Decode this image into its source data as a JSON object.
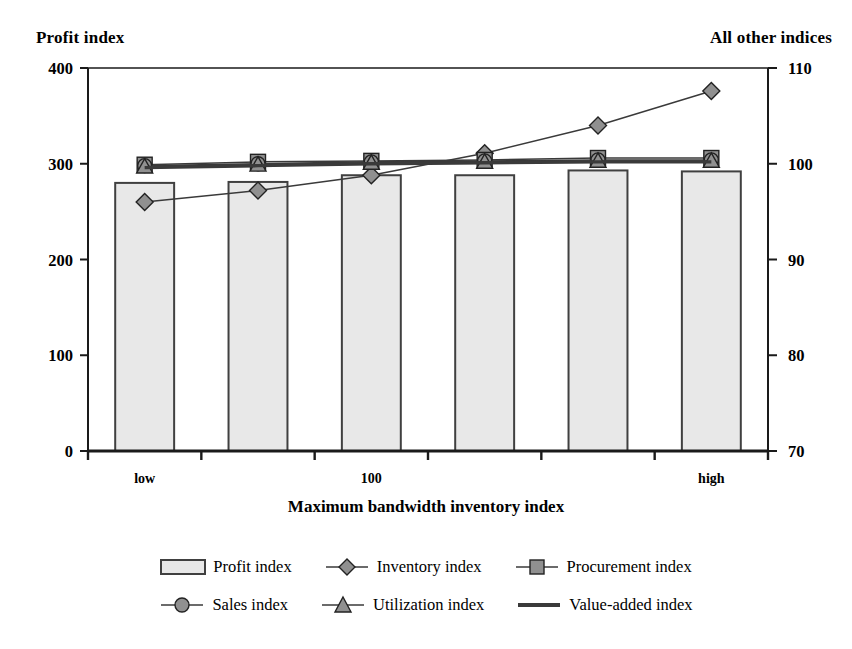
{
  "axis_titles": {
    "left": "Profit index",
    "right": "All other indices",
    "x": "Maximum bandwidth inventory index"
  },
  "colors": {
    "bar_fill": "#e8e8e8",
    "bar_border": "#404040",
    "marker_fill": "#909090",
    "line": "#3a3a3a",
    "axis": "#1a1a1a",
    "text": "#000000"
  },
  "chart_data": {
    "type": "bar",
    "title": "",
    "xlabel": "Maximum bandwidth inventory index",
    "ylabel": "Profit index",
    "y2label": "All other indices",
    "ylim": [
      0,
      400
    ],
    "y2lim": [
      70,
      110
    ],
    "yticks": [
      0,
      100,
      200,
      300,
      400
    ],
    "y2ticks": [
      70,
      80,
      90,
      100,
      110
    ],
    "grid": false,
    "legend_position": "bottom",
    "categories": [
      "low",
      "",
      "100",
      "",
      "",
      "high"
    ],
    "xtick_labels": [
      "low",
      "100",
      "high"
    ],
    "series": [
      {
        "name": "Profit index",
        "type": "bar",
        "axis": "right",
        "values": [
          98.0,
          98.1,
          98.8,
          98.8,
          99.3,
          99.2
        ],
        "marker": "bar-swatch"
      },
      {
        "name": "Inventory index",
        "type": "line",
        "axis": "right",
        "values": [
          96.0,
          97.2,
          98.8,
          101.1,
          104.0,
          107.6
        ],
        "marker": "diamond"
      },
      {
        "name": "Procurement index",
        "type": "line",
        "axis": "right",
        "values": [
          99.9,
          100.2,
          100.3,
          100.4,
          100.6,
          100.6
        ],
        "marker": "square"
      },
      {
        "name": "Sales index",
        "type": "line",
        "axis": "right",
        "values": [
          99.8,
          100.0,
          100.2,
          100.3,
          100.4,
          100.4
        ],
        "marker": "circle"
      },
      {
        "name": "Utilization index",
        "type": "line",
        "axis": "right",
        "values": [
          99.7,
          99.9,
          100.1,
          100.2,
          100.3,
          100.3
        ],
        "marker": "triangle"
      },
      {
        "name": "Value-added index",
        "type": "line",
        "axis": "right",
        "values": [
          99.6,
          99.8,
          100.0,
          100.1,
          100.2,
          100.2
        ],
        "marker": "thick-line"
      }
    ]
  },
  "legend": {
    "rows": [
      [
        {
          "label": "Profit index",
          "marker": "bar-swatch"
        },
        {
          "label": "Inventory index",
          "marker": "diamond"
        },
        {
          "label": "Procurement index",
          "marker": "square"
        }
      ],
      [
        {
          "label": "Sales index",
          "marker": "circle"
        },
        {
          "label": "Utilization index",
          "marker": "triangle"
        },
        {
          "label": "Value-added index",
          "marker": "thick-line"
        }
      ]
    ]
  }
}
